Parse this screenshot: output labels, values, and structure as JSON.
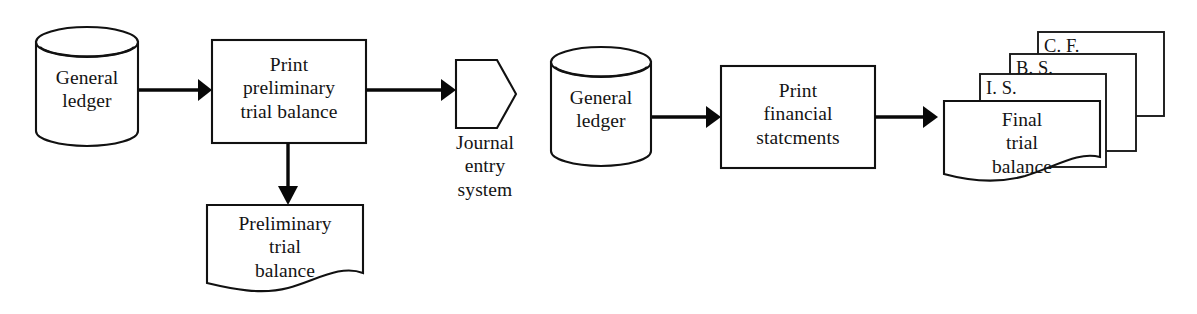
{
  "diagram": {
    "type": "flowchart",
    "background_color": "#ffffff",
    "line_color": "#111111",
    "text_color": "#141414"
  },
  "left_flow": {
    "general_ledger": {
      "label": "General\nledger",
      "shape": "cylinder-database"
    },
    "print_preliminary": {
      "label": "Print\npreliminary\ntrial balance",
      "shape": "process-rectangle"
    },
    "journal_entry_system": {
      "label": "Journal\nentry\nsystem",
      "shape": "pentagon-offpage-connector"
    },
    "preliminary_trial_balance": {
      "label": "Preliminary\ntrial\nbalance",
      "shape": "document-wavy-bottom"
    },
    "arrows": [
      {
        "name": "ledger-to-print",
        "direction": "right"
      },
      {
        "name": "print-to-journal-entry",
        "direction": "right"
      },
      {
        "name": "print-to-preliminary-doc",
        "direction": "down"
      }
    ]
  },
  "right_flow": {
    "general_ledger": {
      "label": "General\nledger",
      "shape": "cylinder-database"
    },
    "print_financial": {
      "label": "Print\nfinancial\nstatcments",
      "shape": "process-rectangle"
    },
    "final_trial_balance": {
      "label": "Final\ntrial\nbalance",
      "shape": "document-wavy-bottom"
    },
    "stacked_statements": [
      {
        "label": "C. F.",
        "name": "cash-flow-statement"
      },
      {
        "label": "B. S.",
        "name": "balance-sheet"
      },
      {
        "label": "I. S.",
        "name": "income-statement"
      }
    ],
    "arrows": [
      {
        "name": "ledger-to-print",
        "direction": "right"
      },
      {
        "name": "print-to-final-docs",
        "direction": "right"
      }
    ]
  }
}
